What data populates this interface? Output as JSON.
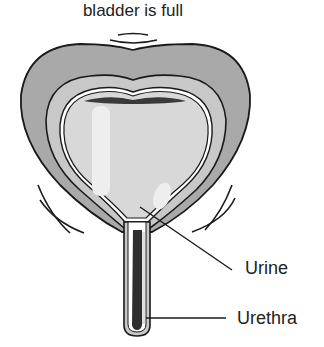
{
  "diagram": {
    "title": "bladder is full",
    "labels": {
      "urine": "Urine",
      "urethra": "Urethra"
    },
    "colors": {
      "outer_wall": "#a9a9a9",
      "middle_wall": "#c6c6c6",
      "inner_cavity": "#d8d8d8",
      "highlight": "#eeeeee",
      "dark_band": "#3a3a3a",
      "outline": "#1a1a1a",
      "label_text": "#222222"
    },
    "icons": [
      "vibration-arcs-top",
      "vibration-arcs-left",
      "vibration-arcs-right"
    ]
  }
}
